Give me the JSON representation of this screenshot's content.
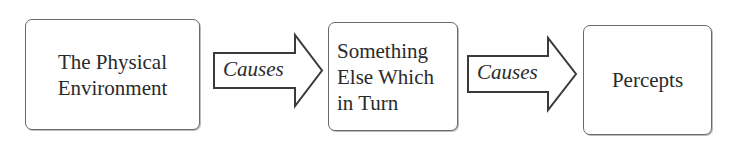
{
  "diagram": {
    "type": "flow",
    "direction": "left-to-right",
    "nodes": [
      {
        "id": "physical-environment",
        "lines": [
          "The Physical",
          "Environment"
        ]
      },
      {
        "id": "something-else",
        "lines": [
          "Something",
          "Else Which",
          "in Turn"
        ]
      },
      {
        "id": "percepts",
        "lines": [
          "Percepts"
        ]
      }
    ],
    "edges": [
      {
        "from": "physical-environment",
        "to": "something-else",
        "label": "Causes"
      },
      {
        "from": "something-else",
        "to": "percepts",
        "label": "Causes"
      }
    ],
    "colors": {
      "stroke": "#4a4a4a",
      "text": "#2a2a2a",
      "background": "#ffffff"
    }
  }
}
